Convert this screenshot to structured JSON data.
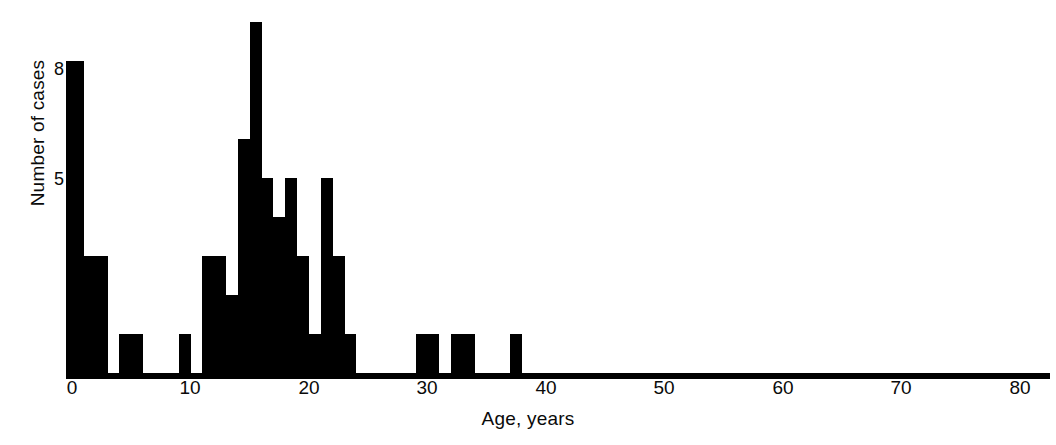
{
  "chart_data": {
    "type": "bar",
    "title": "",
    "subtitle": "",
    "xlabel": "Age, years",
    "ylabel": "Number of cases",
    "xlim": [
      0,
      81
    ],
    "ylim": [
      0,
      9
    ],
    "grid": false,
    "legend": null,
    "bin_width": 1,
    "x_ticks": [
      0,
      10,
      20,
      30,
      40,
      50,
      60,
      70,
      80
    ],
    "x_tick_labels": [
      "0",
      "10",
      "20",
      "30",
      "40",
      "50",
      "60",
      "70",
      "80"
    ],
    "y_ticks": [
      5,
      8
    ],
    "y_tick_labels": [
      "5",
      "8"
    ],
    "categories": [
      0,
      1,
      2,
      3,
      4,
      5,
      6,
      7,
      8,
      9,
      10,
      11,
      12,
      13,
      14,
      15,
      16,
      17,
      18,
      19,
      20,
      21,
      22,
      23,
      24,
      25,
      26,
      27,
      28,
      29,
      30,
      31,
      32,
      33,
      34,
      35,
      36,
      37,
      38,
      39,
      40,
      41,
      42,
      43,
      44,
      45,
      46,
      47,
      48,
      49,
      50,
      51,
      52,
      53,
      54,
      55,
      56,
      57,
      58,
      59,
      60,
      61,
      62,
      63,
      64,
      65,
      66,
      67,
      68,
      69,
      70,
      71,
      72,
      73,
      74,
      75,
      76,
      77,
      78,
      79,
      80
    ],
    "values": [
      8,
      3,
      3,
      0,
      1,
      1,
      0,
      0,
      0,
      1,
      0,
      3,
      3,
      2,
      6,
      9,
      5,
      4,
      5,
      3,
      1,
      5,
      3,
      1,
      0,
      0,
      0,
      0,
      0,
      1,
      1,
      0,
      1,
      1,
      0,
      0,
      0,
      1,
      0,
      0,
      0,
      0,
      0,
      0,
      0,
      0,
      0,
      0,
      0,
      0,
      0,
      0,
      0,
      0,
      0,
      0,
      0,
      0,
      0,
      0,
      0,
      0,
      0,
      0,
      0,
      0,
      0,
      0,
      0,
      0,
      0,
      0,
      0,
      0,
      0,
      0,
      0,
      0,
      0,
      0,
      0
    ],
    "series": [
      {
        "name": "Number of cases",
        "values": [
          8,
          3,
          3,
          0,
          1,
          1,
          0,
          0,
          0,
          1,
          0,
          3,
          3,
          2,
          6,
          9,
          5,
          4,
          5,
          3,
          1,
          5,
          3,
          1,
          0,
          0,
          0,
          0,
          0,
          1,
          1,
          0,
          1,
          1,
          0,
          0,
          0,
          1,
          0,
          0,
          0,
          0,
          0,
          0,
          0,
          0,
          0,
          0,
          0,
          0,
          0,
          0,
          0,
          0,
          0,
          0,
          0,
          0,
          0,
          0,
          0,
          0,
          0,
          0,
          0,
          0,
          0,
          0,
          0,
          0,
          0,
          0,
          0,
          0,
          0,
          0,
          0,
          0,
          0,
          0,
          0
        ]
      }
    ],
    "color": "#000000",
    "total_cases": 66,
    "annotations": []
  },
  "axes": {
    "x_title": "Age, years",
    "y_title": "Number of cases",
    "x_tick_labels": [
      "0",
      "10",
      "20",
      "30",
      "40",
      "50",
      "60",
      "70",
      "80"
    ],
    "y_tick_labels": [
      "8",
      "5"
    ]
  }
}
